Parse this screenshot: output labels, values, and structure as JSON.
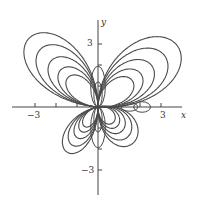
{
  "figure": {
    "type": "polar-curve-family",
    "axes": {
      "x_label": "x",
      "y_label": "y",
      "x_ticks": [
        -3,
        3
      ],
      "y_ticks": [
        3,
        -3
      ],
      "x_tick_labels": {
        "neg": "−3",
        "pos": "3"
      },
      "y_tick_labels": {
        "pos": "3",
        "neg": "−3"
      }
    },
    "stroke_color": "#4a4a4a",
    "curves": [
      {
        "a": 1.6,
        "b": 1.0
      },
      {
        "a": 2.0,
        "b": 1.3
      },
      {
        "a": 2.5,
        "b": 1.7
      },
      {
        "a": 3.1,
        "b": 2.1
      },
      {
        "a": 3.7,
        "b": 2.4
      }
    ]
  }
}
